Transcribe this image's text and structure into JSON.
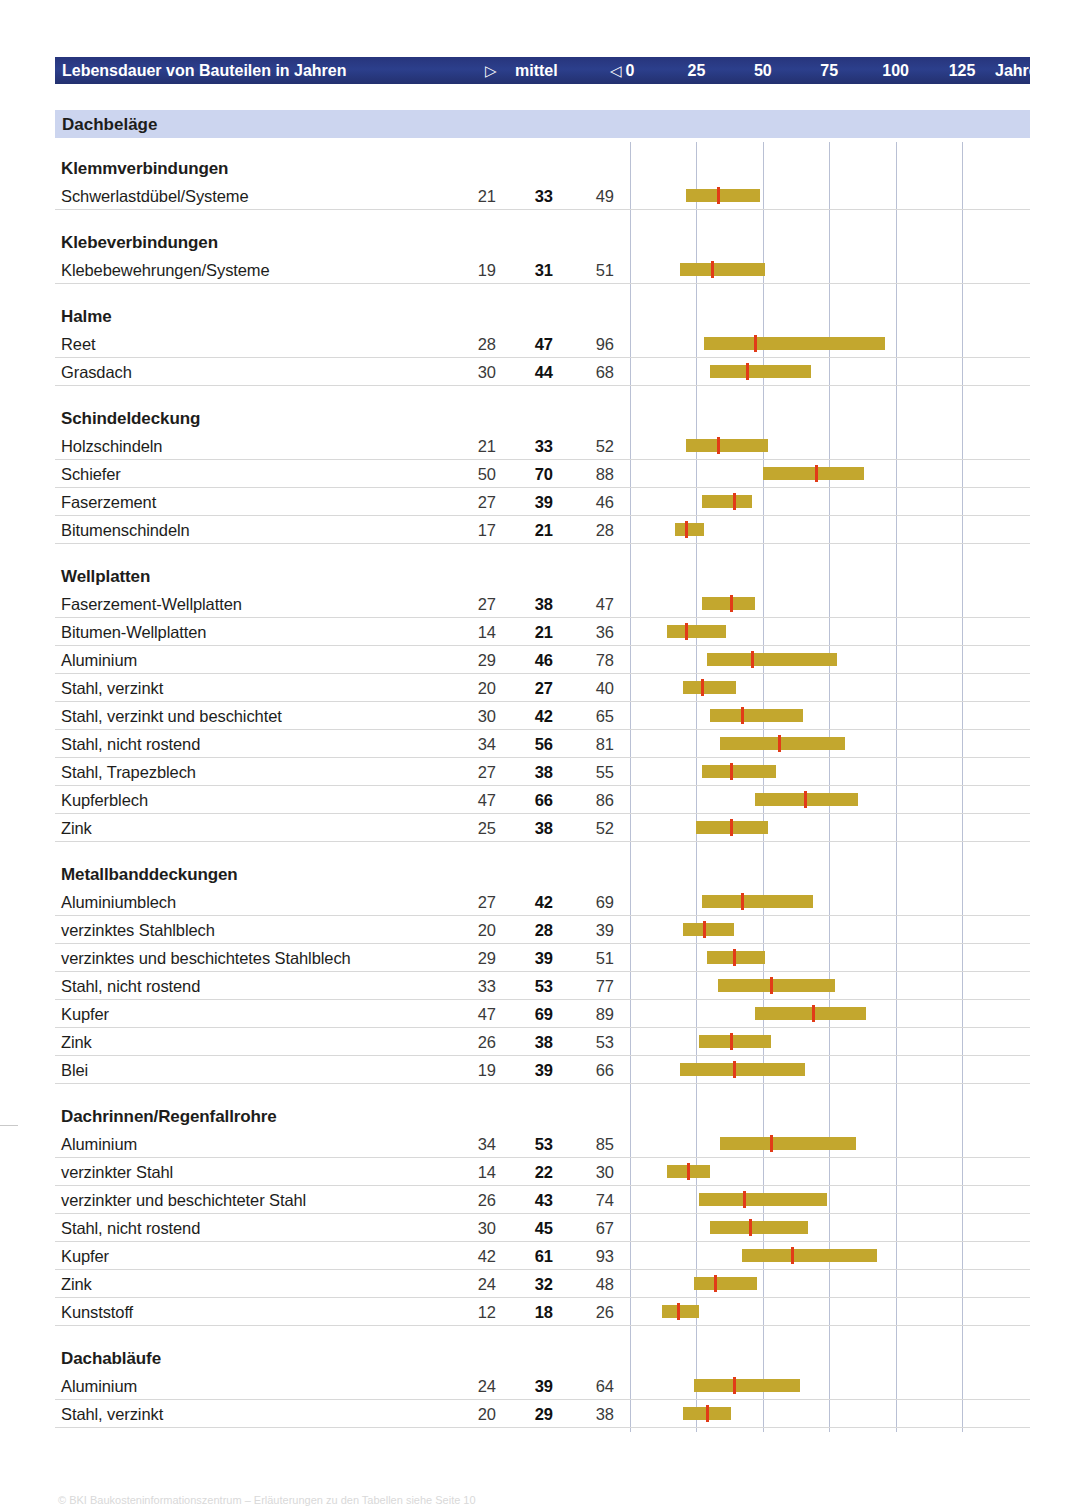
{
  "header": {
    "title": "Lebensdauer von Bauteilen in Jahren",
    "tri_right": "▷",
    "mittel": "mittel",
    "tri_left": "◁",
    "axis_ticks": [
      "0",
      "25",
      "50",
      "75",
      "100",
      "125"
    ],
    "unit": "Jahre",
    "bar_color": "#2b3d85",
    "text_color": "#ffffff"
  },
  "section": {
    "label": "Dachbeläge",
    "band_color": "#ccd5ef"
  },
  "colors": {
    "range_bar": "#c3a72e",
    "mean_marker": "#e23b18",
    "gridline": "#b9c0d4",
    "row_rule": "#d8d8d8"
  },
  "axis": {
    "min": 0,
    "max": 125,
    "step": 25,
    "unit": "Jahre"
  },
  "footer": {
    "text": "© BKI Baukosteninformationszentrum  –  Erläuterungen zu den Tabellen siehe Seite 10"
  },
  "chart_data": {
    "type": "bar",
    "title": "Lebensdauer von Bauteilen in Jahren",
    "subtitle": "Dachbeläge",
    "xlabel": "Jahre",
    "ylabel": "",
    "xlim": [
      0,
      125
    ],
    "grid": true,
    "columns": [
      "Bauteil",
      "min",
      "mittel",
      "max"
    ],
    "groups": [
      {
        "name": "Klemmverbindungen",
        "rows": [
          {
            "label": "Schwerlastdübel/Systeme",
            "min": 21,
            "mid": 33,
            "max": 49
          }
        ]
      },
      {
        "name": "Klebeverbindungen",
        "rows": [
          {
            "label": "Klebebewehrungen/Systeme",
            "min": 19,
            "mid": 31,
            "max": 51
          }
        ]
      },
      {
        "name": "Halme",
        "rows": [
          {
            "label": "Reet",
            "min": 28,
            "mid": 47,
            "max": 96
          },
          {
            "label": "Grasdach",
            "min": 30,
            "mid": 44,
            "max": 68
          }
        ]
      },
      {
        "name": "Schindeldeckung",
        "rows": [
          {
            "label": "Holzschindeln",
            "min": 21,
            "mid": 33,
            "max": 52
          },
          {
            "label": "Schiefer",
            "min": 50,
            "mid": 70,
            "max": 88
          },
          {
            "label": "Faserzement",
            "min": 27,
            "mid": 39,
            "max": 46
          },
          {
            "label": "Bitumenschindeln",
            "min": 17,
            "mid": 21,
            "max": 28
          }
        ]
      },
      {
        "name": "Wellplatten",
        "rows": [
          {
            "label": "Faserzement-Wellplatten",
            "min": 27,
            "mid": 38,
            "max": 47
          },
          {
            "label": "Bitumen-Wellplatten",
            "min": 14,
            "mid": 21,
            "max": 36
          },
          {
            "label": "Aluminium",
            "min": 29,
            "mid": 46,
            "max": 78
          },
          {
            "label": "Stahl, verzinkt",
            "min": 20,
            "mid": 27,
            "max": 40
          },
          {
            "label": "Stahl, verzinkt und beschichtet",
            "min": 30,
            "mid": 42,
            "max": 65
          },
          {
            "label": "Stahl, nicht rostend",
            "min": 34,
            "mid": 56,
            "max": 81
          },
          {
            "label": "Stahl, Trapezblech",
            "min": 27,
            "mid": 38,
            "max": 55
          },
          {
            "label": "Kupferblech",
            "min": 47,
            "mid": 66,
            "max": 86
          },
          {
            "label": "Zink",
            "min": 25,
            "mid": 38,
            "max": 52
          }
        ]
      },
      {
        "name": "Metallbanddeckungen",
        "rows": [
          {
            "label": "Aluminiumblech",
            "min": 27,
            "mid": 42,
            "max": 69
          },
          {
            "label": "verzinktes Stahlblech",
            "min": 20,
            "mid": 28,
            "max": 39
          },
          {
            "label": "verzinktes und beschichtetes Stahlblech",
            "min": 29,
            "mid": 39,
            "max": 51
          },
          {
            "label": "Stahl, nicht rostend",
            "min": 33,
            "mid": 53,
            "max": 77
          },
          {
            "label": "Kupfer",
            "min": 47,
            "mid": 69,
            "max": 89
          },
          {
            "label": "Zink",
            "min": 26,
            "mid": 38,
            "max": 53
          },
          {
            "label": "Blei",
            "min": 19,
            "mid": 39,
            "max": 66
          }
        ]
      },
      {
        "name": "Dachrinnen/Regenfallrohre",
        "rows": [
          {
            "label": "Aluminium",
            "min": 34,
            "mid": 53,
            "max": 85
          },
          {
            "label": "verzinkter Stahl",
            "min": 14,
            "mid": 22,
            "max": 30
          },
          {
            "label": "verzinkter und beschichteter Stahl",
            "min": 26,
            "mid": 43,
            "max": 74
          },
          {
            "label": "Stahl, nicht rostend",
            "min": 30,
            "mid": 45,
            "max": 67
          },
          {
            "label": "Kupfer",
            "min": 42,
            "mid": 61,
            "max": 93
          },
          {
            "label": "Zink",
            "min": 24,
            "mid": 32,
            "max": 48
          },
          {
            "label": "Kunststoff",
            "min": 12,
            "mid": 18,
            "max": 26
          }
        ]
      },
      {
        "name": "Dachabläufe",
        "rows": [
          {
            "label": "Aluminium",
            "min": 24,
            "mid": 39,
            "max": 64
          },
          {
            "label": "Stahl, verzinkt",
            "min": 20,
            "mid": 29,
            "max": 38
          }
        ]
      }
    ]
  }
}
